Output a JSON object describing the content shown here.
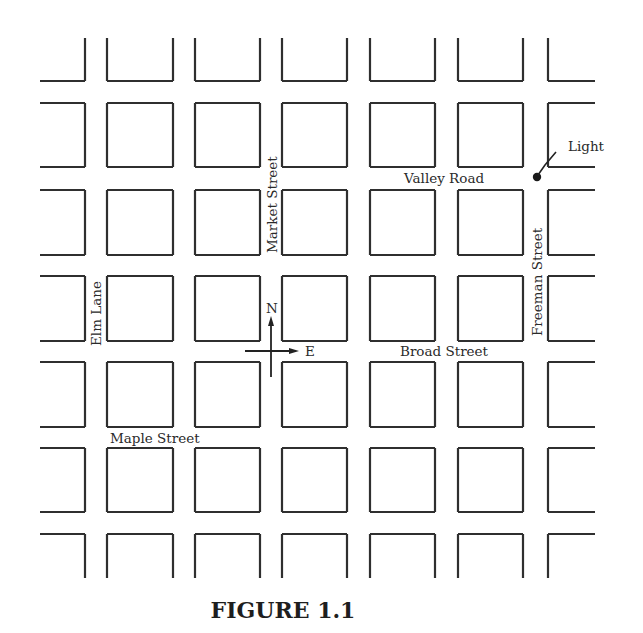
{
  "figure": {
    "caption": "FIGURE 1.1"
  },
  "map": {
    "grid": {
      "columns": [
        [
          40,
          85
        ],
        [
          107,
          173
        ],
        [
          195,
          260
        ],
        [
          282,
          347
        ],
        [
          370,
          435
        ],
        [
          458,
          523
        ],
        [
          548,
          595
        ]
      ],
      "rows": [
        [
          38,
          81
        ],
        [
          103,
          167
        ],
        [
          190,
          255
        ],
        [
          276,
          341
        ],
        [
          362,
          427
        ],
        [
          448,
          512
        ],
        [
          534,
          578
        ]
      ],
      "line_color": "#2f2f2f"
    },
    "streets": {
      "valley_road": "Valley Road",
      "broad_street": "Broad Street",
      "maple_street": "Maple Street",
      "market_street": "Market Street",
      "elm_lane": "Elm Lane",
      "freeman_street": "Freeman Street"
    },
    "landmarks": {
      "light": "Light"
    },
    "compass": {
      "north": "N",
      "east": "E"
    }
  }
}
